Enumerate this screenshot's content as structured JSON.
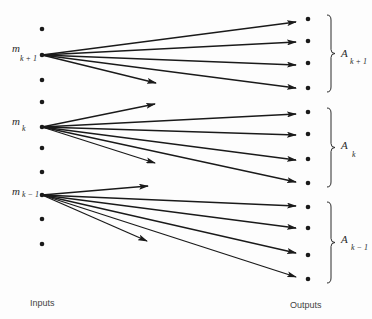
{
  "diagram": {
    "type": "mapping-diagram",
    "inputs_label": "Inputs",
    "outputs_label": "Outputs",
    "input_nodes": [
      {
        "y": 29
      },
      {
        "y": 55,
        "label": "m",
        "sub": "k + 1"
      },
      {
        "y": 80
      },
      {
        "y": 102
      },
      {
        "y": 127,
        "label": "m",
        "sub": "k"
      },
      {
        "y": 148
      },
      {
        "y": 172
      },
      {
        "y": 195,
        "label": "m",
        "sub": "k − 1"
      },
      {
        "y": 219
      },
      {
        "y": 244
      }
    ],
    "output_nodes": [
      19,
      41,
      63,
      88,
      112,
      134,
      159,
      183,
      207,
      228,
      255,
      279
    ],
    "groups": [
      {
        "label": "A",
        "sub": "k + 1",
        "top": 15,
        "bottom": 92,
        "outputs": [
          0,
          1,
          2,
          3
        ]
      },
      {
        "label": "A",
        "sub": "k",
        "top": 108,
        "bottom": 187,
        "outputs": [
          4,
          5,
          6,
          7
        ]
      },
      {
        "label": "A",
        "sub": "k − 1",
        "top": 202,
        "bottom": 283,
        "outputs": [
          8,
          9,
          10,
          11
        ]
      }
    ],
    "edges": [
      {
        "from": 55,
        "to": [
          296,
          22
        ]
      },
      {
        "from": 55,
        "to": [
          296,
          42
        ]
      },
      {
        "from": 55,
        "to": [
          296,
          65
        ]
      },
      {
        "from": 55,
        "to": [
          296,
          88
        ]
      },
      {
        "from": 55,
        "to": [
          156,
          83
        ]
      },
      {
        "from": 127,
        "to": [
          155,
          104
        ]
      },
      {
        "from": 127,
        "to": [
          296,
          114
        ]
      },
      {
        "from": 127,
        "to": [
          296,
          135
        ]
      },
      {
        "from": 127,
        "to": [
          296,
          160
        ]
      },
      {
        "from": 127,
        "to": [
          296,
          182
        ]
      },
      {
        "from": 127,
        "to": [
          155,
          163
        ]
      },
      {
        "from": 195,
        "to": [
          148,
          186
        ]
      },
      {
        "from": 195,
        "to": [
          296,
          206
        ]
      },
      {
        "from": 195,
        "to": [
          296,
          228
        ]
      },
      {
        "from": 195,
        "to": [
          296,
          253
        ]
      },
      {
        "from": 195,
        "to": [
          296,
          277
        ]
      },
      {
        "from": 195,
        "to": [
          147,
          241
        ]
      }
    ]
  },
  "labels": {
    "m": "m",
    "m_kp1_sub": "k + 1",
    "m_k_sub": "k",
    "m_km1_sub": "k − 1",
    "A": "A",
    "A_kp1_sub": "k + 1",
    "A_k_sub": "k",
    "A_km1_sub": "k − 1",
    "inputs": "Inputs",
    "outputs": "Outputs"
  }
}
